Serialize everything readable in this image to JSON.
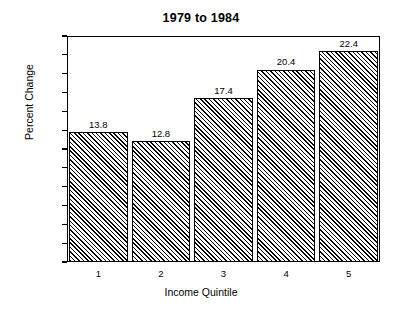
{
  "chart_data": {
    "type": "bar",
    "title": "1979 to 1984",
    "xlabel": "Income Quintile",
    "ylabel": "Percent Change",
    "categories": [
      "1",
      "2",
      "3",
      "4",
      "5"
    ],
    "values": [
      13.8,
      12.8,
      17.4,
      20.4,
      22.4
    ],
    "value_labels": [
      "13.8",
      "12.8",
      "17.4",
      "20.4",
      "22.4"
    ],
    "ylim": [
      0,
      24
    ],
    "ytick_values": [
      24,
      22,
      20,
      18,
      16,
      14,
      12,
      10,
      8,
      6,
      4,
      2,
      0
    ],
    "ytick_labels": [
      "24%",
      "22%",
      "20%",
      "18%",
      "16%",
      "14%",
      "12%",
      "10%",
      "8%",
      "6%",
      "4%",
      "2%",
      "0"
    ],
    "grid": false,
    "legend": "none",
    "bar_fill": "diagonal-hatch",
    "bar_edge_color": "#000000",
    "background_color": "#ffffff",
    "text_color": "#000000"
  }
}
